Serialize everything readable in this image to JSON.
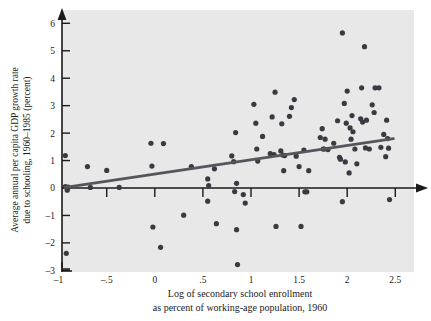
{
  "chart_data": {
    "type": "scatter",
    "title": "",
    "xlabel": "Log of secondary school enrollment as percent of working-age population, 1960",
    "xlabel_line1": "Log of secondary school enrollment",
    "xlabel_line2": "as percent of working-age population, 1960",
    "ylabel": "Average annual per capita GDP growth rate due to schooling, 1960–1985 (percent)",
    "ylabel_line1": "Average annual per capita GDP growth rate",
    "ylabel_line2": "due to schooling, 1960–1985 (percent)",
    "xlim": [
      -1.0,
      2.6
    ],
    "ylim": [
      -3.0,
      6.4
    ],
    "xticks": [
      -1,
      -0.5,
      0,
      0.5,
      1,
      1.5,
      2,
      2.5
    ],
    "xticklabels": [
      "–1",
      "–.5",
      "0",
      ".5",
      "1",
      "1.5",
      "2",
      "2.5"
    ],
    "yticks": [
      -3,
      -2,
      -1,
      0,
      1,
      2,
      3,
      4,
      5,
      6
    ],
    "yticklabels": [
      "–3",
      "–2",
      "–1",
      "0",
      "1",
      "2",
      "3",
      "4",
      "5",
      "6"
    ],
    "grid": false,
    "legend": null,
    "background_color": "#e8e8e8",
    "point_color": "#3a3a42",
    "line_color": "#55555c",
    "axis_color": "#1a1a1a",
    "trendline": {
      "label": "fitted regression line",
      "x": [
        -0.93,
        2.48
      ],
      "y": [
        0.02,
        1.8
      ]
    },
    "points": [
      [
        -0.93,
        1.18
      ],
      [
        -0.93,
        0.05
      ],
      [
        -0.91,
        -0.08
      ],
      [
        -0.92,
        -2.38
      ],
      [
        -0.9,
        0.03
      ],
      [
        -0.7,
        0.78
      ],
      [
        -0.67,
        0.02
      ],
      [
        -0.5,
        0.64
      ],
      [
        -0.37,
        0.02
      ],
      [
        -0.04,
        1.63
      ],
      [
        -0.03,
        0.8
      ],
      [
        -0.02,
        -1.42
      ],
      [
        0.06,
        -2.16
      ],
      [
        0.09,
        1.62
      ],
      [
        0.3,
        -0.99
      ],
      [
        0.38,
        0.78
      ],
      [
        0.55,
        0.33
      ],
      [
        0.56,
        0.09
      ],
      [
        0.55,
        -0.48
      ],
      [
        0.62,
        0.7
      ],
      [
        0.64,
        -1.3
      ],
      [
        0.8,
        1.17
      ],
      [
        0.82,
        0.96
      ],
      [
        0.83,
        -0.13
      ],
      [
        0.84,
        2.02
      ],
      [
        0.85,
        0.17
      ],
      [
        0.85,
        -1.52
      ],
      [
        0.86,
        -2.79
      ],
      [
        0.92,
        -0.24
      ],
      [
        0.94,
        -0.55
      ],
      [
        1.03,
        3.05
      ],
      [
        1.05,
        2.36
      ],
      [
        1.06,
        1.42
      ],
      [
        1.07,
        0.98
      ],
      [
        1.12,
        1.88
      ],
      [
        1.2,
        1.25
      ],
      [
        1.22,
        2.59
      ],
      [
        1.24,
        1.22
      ],
      [
        1.25,
        3.49
      ],
      [
        1.26,
        -1.4
      ],
      [
        1.31,
        1.35
      ],
      [
        1.32,
        2.34
      ],
      [
        1.33,
        1.2
      ],
      [
        1.34,
        0.63
      ],
      [
        1.35,
        1.18
      ],
      [
        1.4,
        2.61
      ],
      [
        1.42,
        2.93
      ],
      [
        1.45,
        3.22
      ],
      [
        1.47,
        1.16
      ],
      [
        1.5,
        0.78
      ],
      [
        1.52,
        -1.4
      ],
      [
        1.55,
        1.38
      ],
      [
        1.56,
        -0.14
      ],
      [
        1.58,
        -0.14
      ],
      [
        1.6,
        0.63
      ],
      [
        1.72,
        1.84
      ],
      [
        1.74,
        2.16
      ],
      [
        1.75,
        1.42
      ],
      [
        1.76,
        1.42
      ],
      [
        1.77,
        1.78
      ],
      [
        1.8,
        1.4
      ],
      [
        1.86,
        1.63
      ],
      [
        1.9,
        2.45
      ],
      [
        1.92,
        1.12
      ],
      [
        1.93,
        1.05
      ],
      [
        1.95,
        5.65
      ],
      [
        1.95,
        -0.5
      ],
      [
        1.97,
        3.08
      ],
      [
        1.98,
        0.95
      ],
      [
        1.99,
        2.36
      ],
      [
        2.0,
        3.53
      ],
      [
        2.02,
        0.55
      ],
      [
        2.03,
        2.19
      ],
      [
        2.04,
        1.78
      ],
      [
        2.05,
        2.64
      ],
      [
        2.06,
        2.05
      ],
      [
        2.08,
        1.42
      ],
      [
        2.1,
        0.88
      ],
      [
        2.14,
        2.52
      ],
      [
        2.15,
        3.65
      ],
      [
        2.16,
        2.4
      ],
      [
        2.18,
        5.15
      ],
      [
        2.19,
        1.46
      ],
      [
        2.2,
        2.47
      ],
      [
        2.23,
        1.42
      ],
      [
        2.26,
        3.03
      ],
      [
        2.28,
        2.75
      ],
      [
        2.29,
        3.65
      ],
      [
        2.33,
        3.65
      ],
      [
        2.35,
        1.48
      ],
      [
        2.38,
        1.95
      ],
      [
        2.4,
        1.14
      ],
      [
        2.41,
        2.47
      ],
      [
        2.42,
        1.8
      ],
      [
        2.43,
        1.45
      ],
      [
        2.44,
        -0.42
      ]
    ]
  }
}
